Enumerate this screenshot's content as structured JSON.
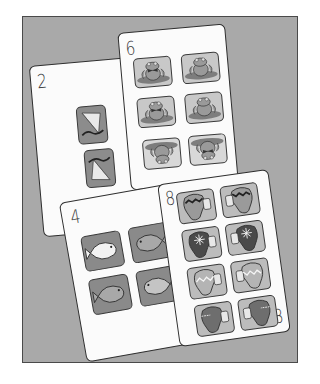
{
  "scene": {
    "background_color": "#ffffff",
    "table_color": "#a9a9a9",
    "card_color": "#fbfbfb"
  },
  "cards": [
    {
      "id": "card-2",
      "rank": "2",
      "picture": "kite",
      "count": 2,
      "tiles": [
        "kite",
        "kite-flipped"
      ]
    },
    {
      "id": "card-6",
      "rank": "6",
      "picture": "frog",
      "count": 6,
      "tiles": [
        "frog-bowtie",
        "frog",
        "frog-bowtie",
        "frog",
        "frog-upside-down",
        "frog-bowtie-upside-down"
      ]
    },
    {
      "id": "card-4",
      "rank": "4",
      "picture": "fish",
      "count": 4,
      "tiles": [
        "fish-white",
        "fish-gray",
        "fish-gray",
        "fish-striped"
      ]
    },
    {
      "id": "card-8",
      "rank": "8",
      "rank_bottom": "8",
      "picture": "mitten",
      "count": 8,
      "tiles": [
        "mitten-zigzag",
        "mitten-zigzag",
        "mitten-snowflake",
        "mitten-snowflake",
        "mitten-light-zigzag",
        "mitten-light-zigzag",
        "mitten-dark-band",
        "mitten-dark-band"
      ]
    }
  ]
}
